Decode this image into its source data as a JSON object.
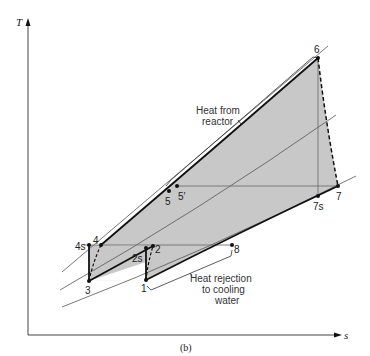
{
  "figure": {
    "caption": "(b)",
    "axes": {
      "y_label": "T",
      "x_label": "s"
    },
    "state_points": {
      "p1": "1",
      "p2": "2",
      "p2s": "2s",
      "p3": "3",
      "p4": "4",
      "p4s": "4s",
      "p5": "5",
      "p5prime": "5′",
      "p6": "6",
      "p7": "7",
      "p7s": "7s",
      "p8": "8"
    },
    "annotations": {
      "heat_in_line1": "Heat from",
      "heat_in_line2": "reactor",
      "heat_out_line1": "Heat rejection",
      "heat_out_line2": "to cooling",
      "heat_out_line3": "water"
    },
    "colors": {
      "shaded_region": "#c8c8c8",
      "cycle_line": "#111111",
      "isobar_line": "#555555",
      "axis": "#444444"
    }
  }
}
